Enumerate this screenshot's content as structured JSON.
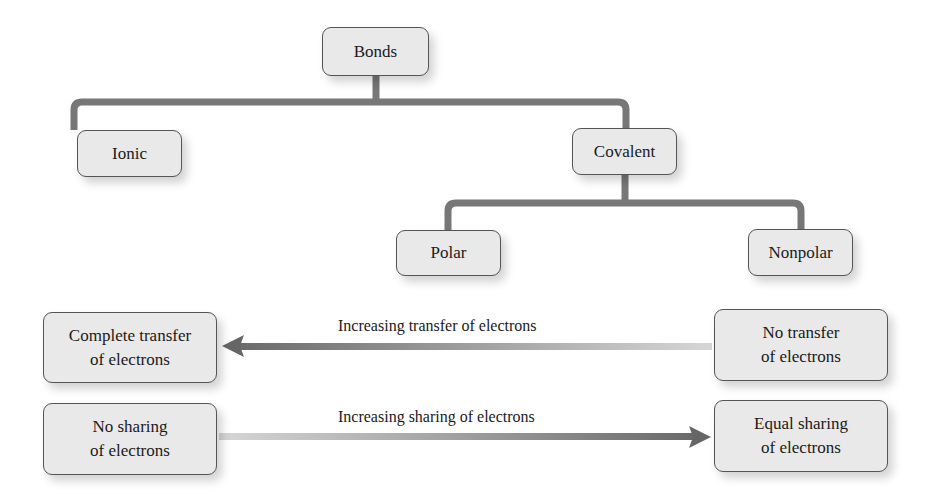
{
  "diagram": {
    "tree": {
      "root": "Bonds",
      "level1": [
        "Ionic",
        "Covalent"
      ],
      "covalent_children": [
        "Polar",
        "Nonpolar"
      ]
    },
    "spectra": [
      {
        "left_box": "Complete transfer\nof electrons",
        "right_box": "No transfer\nof electrons",
        "arrow_label": "Increasing transfer of electrons",
        "arrow_direction": "left"
      },
      {
        "left_box": "No sharing\nof electrons",
        "right_box": "Equal sharing\nof electrons",
        "arrow_label": "Increasing sharing of electrons",
        "arrow_direction": "right"
      }
    ]
  },
  "labels": {
    "bonds": "Bonds",
    "ionic": "Ionic",
    "covalent": "Covalent",
    "polar": "Polar",
    "nonpolar": "Nonpolar",
    "complete_transfer_l1": "Complete transfer",
    "complete_transfer_l2": "of electrons",
    "no_transfer_l1": "No transfer",
    "no_transfer_l2": "of electrons",
    "no_sharing_l1": "No sharing",
    "no_sharing_l2": "of electrons",
    "equal_sharing_l1": "Equal sharing",
    "equal_sharing_l2": "of electrons",
    "transfer_arrow": "Increasing transfer of electrons",
    "sharing_arrow": "Increasing sharing of electrons"
  },
  "colors": {
    "line": "#777777",
    "box_fill": "#e9e9e9",
    "box_border": "#555555"
  }
}
